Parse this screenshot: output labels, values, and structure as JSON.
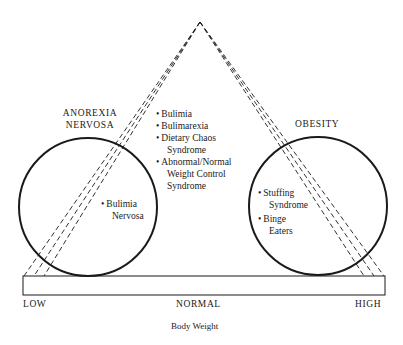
{
  "diagram": {
    "type": "triangle-continuum",
    "left_circle": {
      "title_line1": "ANOREXIA",
      "title_line2": "NERVOSA",
      "items": [
        {
          "line1": "Bulimia",
          "line2": "Nervosa"
        }
      ]
    },
    "center": {
      "items": [
        {
          "line1": "Bulimia"
        },
        {
          "line1": "Bulimarexia"
        },
        {
          "line1": "Dietary Chaos",
          "line2": "Syndrome"
        },
        {
          "line1": "Abnormal/Normal",
          "line2": "Weight Control",
          "line3": "Syndrome"
        }
      ]
    },
    "right_circle": {
      "title": "OBESITY",
      "items": [
        {
          "line1": "Stuffing",
          "line2": "Syndrome"
        },
        {
          "line1": "Binge",
          "line2": "Eaters"
        }
      ]
    },
    "axis": {
      "low": "LOW",
      "normal": "NORMAL",
      "high": "HIGH",
      "title": "Body Weight"
    },
    "colors": {
      "stroke": "#1a1a1a",
      "background": "#ffffff"
    }
  }
}
